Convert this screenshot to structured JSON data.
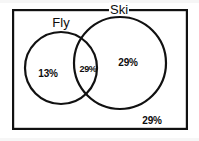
{
  "figure": {
    "stroke_color": "#111111",
    "fill_color": "#ffffff",
    "background_color": "#ffffff"
  },
  "universe": {
    "name": "universal-set-rectangle",
    "x": 12,
    "y": 9,
    "width": 176,
    "height": 121,
    "stroke_width": 2.2
  },
  "sets": [
    {
      "id": "fly",
      "label": "Fly",
      "label_x": 61,
      "label_y": 22,
      "cx": 61,
      "cy": 68,
      "r": 36,
      "stroke_width": 2.2
    },
    {
      "id": "ski",
      "label": "Ski",
      "label_x": 119,
      "label_y": 9,
      "cx": 120,
      "cy": 63,
      "r": 46,
      "stroke_width": 2.2
    }
  ],
  "regions": [
    {
      "id": "fly-only",
      "label": "13%",
      "value": 13,
      "x": 48,
      "y": 74,
      "size": "normal"
    },
    {
      "id": "fly-and-ski",
      "label": "29%",
      "value": 29,
      "x": 88,
      "y": 69,
      "size": "small"
    },
    {
      "id": "ski-only",
      "label": "29%",
      "value": 29,
      "x": 128,
      "y": 63,
      "size": "normal"
    },
    {
      "id": "neither",
      "label": "29%",
      "value": 29,
      "x": 152,
      "y": 121,
      "size": "normal"
    }
  ],
  "chart_data": {
    "type": "venn",
    "title": "",
    "sets": [
      "Fly",
      "Ski"
    ],
    "categories": [
      "Fly only",
      "Fly and Ski",
      "Ski only",
      "Neither"
    ],
    "values": [
      13,
      29,
      29,
      29
    ],
    "unit": "%",
    "labels": [
      "13%",
      "29%",
      "29%",
      "29%"
    ],
    "total": 100,
    "legend": "none",
    "grid": false
  }
}
